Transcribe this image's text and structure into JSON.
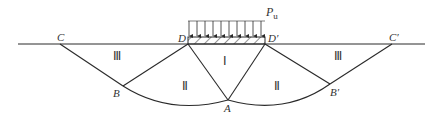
{
  "diagram": {
    "title": "",
    "load_label": "P",
    "load_subscript": "u",
    "points": {
      "C": "C",
      "D": "D",
      "D_prime": "D′",
      "C_prime": "C′",
      "B": "B",
      "B_prime": "B′",
      "A": "A"
    },
    "zones": {
      "zone_I": "Ⅰ",
      "zone_II_left": "Ⅱ",
      "zone_II_right": "Ⅱ",
      "zone_III_left": "Ⅲ",
      "zone_III_right": "Ⅲ"
    },
    "colors": {
      "line": "#2a2a2a",
      "text": "#333333",
      "background": "#ffffff"
    }
  }
}
